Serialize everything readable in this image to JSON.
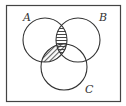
{
  "diagram": {
    "type": "venn",
    "sets": [
      {
        "label": "A",
        "cx": 45,
        "cy": 40,
        "r": 22
      },
      {
        "label": "B",
        "cx": 78,
        "cy": 40,
        "r": 22
      },
      {
        "label": "C",
        "cx": 64,
        "cy": 67,
        "r": 23
      }
    ],
    "shaded_regions": [
      {
        "region": "A∩B",
        "pattern": "horizontal-lines"
      },
      {
        "region": "A∩C",
        "pattern": "diagonal-lines"
      }
    ],
    "colors": {
      "stroke": "#333333",
      "background": "#ffffff"
    }
  }
}
